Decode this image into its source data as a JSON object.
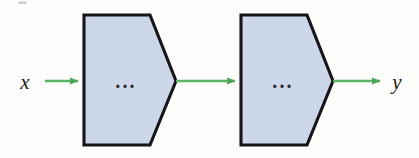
{
  "figure": {
    "background_color": "#fdfdfc",
    "input_label": "x",
    "output_label": "y",
    "block_contents_label": "...",
    "colors": {
      "block_fill": "#ccd7e9",
      "block_stroke": "#15151a",
      "arrow": "#5bb563",
      "arrow_dark": "#3f9a4b",
      "text": "#1a1a1a"
    },
    "blocks": [
      {
        "id": "block-1",
        "label": "...",
        "shape": "pentagon-right",
        "fill": "#ccd7e9",
        "stroke": "#15151a",
        "x": 84,
        "y": 15,
        "width": 92,
        "height": 130
      },
      {
        "id": "block-2",
        "label": "...",
        "shape": "pentagon-right",
        "fill": "#ccd7e9",
        "stroke": "#15151a",
        "x": 241,
        "y": 15,
        "width": 92,
        "height": 130
      }
    ],
    "arrows": [
      {
        "id": "arrow-input",
        "from": "x",
        "to": "block-1",
        "x1": 45,
        "x2": 84,
        "y": 81
      },
      {
        "id": "arrow-middle",
        "from": "block-1",
        "to": "block-2",
        "x1": 176,
        "x2": 241,
        "y": 81
      },
      {
        "id": "arrow-output",
        "from": "block-2",
        "to": "y",
        "x1": 333,
        "x2": 386,
        "y": 81
      }
    ]
  }
}
